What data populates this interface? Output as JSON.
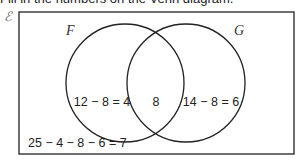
{
  "caption": "Fill in the numbers on the Venn diagram.",
  "diagram": {
    "universal_symbol": "ℰ",
    "set_a": "F",
    "set_b": "G",
    "only_a": "12 − 8 = 4",
    "intersection": "8",
    "only_b": "14 − 8 = 6",
    "outside": "25 − 4 − 8 − 6 = 7"
  }
}
